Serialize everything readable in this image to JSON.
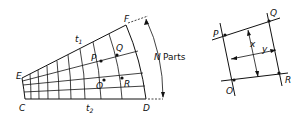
{
  "left_figure": {
    "labels": {
      "E": "E",
      "F": "F",
      "C": "C",
      "D": "D",
      "P": "P",
      "Q": "Q",
      "O": "O",
      "R": "R",
      "t1": "t",
      "t1_sub": "1",
      "t2": "t",
      "t2_sub": "2",
      "n_parts_italic": "N",
      "n_parts": "Parts"
    }
  },
  "right_figure": {
    "labels": {
      "P": "P",
      "Q": "Q",
      "O": "O",
      "R": "R",
      "x": "x",
      "y": "y"
    }
  }
}
